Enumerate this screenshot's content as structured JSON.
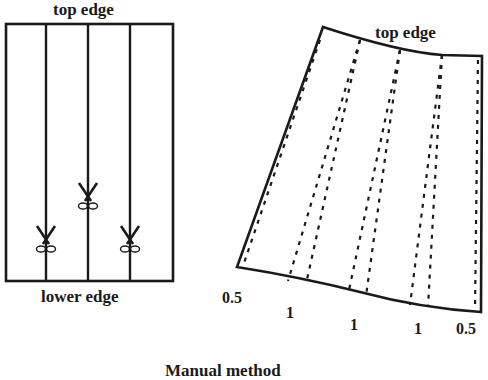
{
  "left_panel": {
    "top_label": "top edge",
    "bottom_label": "lower edge",
    "rect": {
      "x": 6,
      "y": 24,
      "w": 167,
      "h": 257
    },
    "cut_lines_x": [
      46,
      88,
      130
    ],
    "scissors": [
      {
        "x": 46,
        "y": 240,
        "icon": "scissors-icon"
      },
      {
        "x": 88,
        "y": 197,
        "icon": "scissors-icon"
      },
      {
        "x": 130,
        "y": 240,
        "icon": "scissors-icon"
      }
    ]
  },
  "right_panel": {
    "top_label": "top edge",
    "spread_labels": [
      "0.5",
      "1",
      "1",
      "1",
      "0.5"
    ]
  },
  "caption": "Manual method",
  "colors": {
    "ink": "#1a1a1a",
    "background": "#ffffff"
  }
}
